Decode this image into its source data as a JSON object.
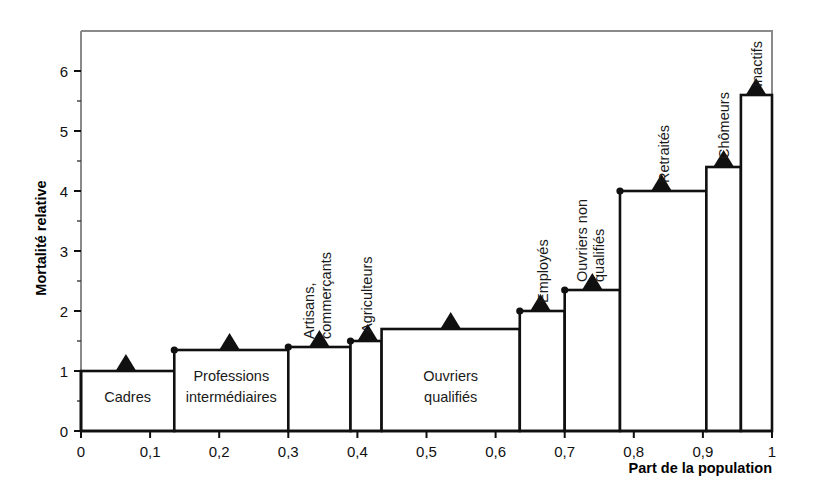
{
  "chart_data": {
    "type": "bar",
    "title": "",
    "xlabel": "Part de la population",
    "ylabel": "Mortalité relative",
    "xlim": [
      0,
      1
    ],
    "ylim": [
      0,
      6.5
    ],
    "grid": false,
    "legend": null,
    "note": "Variable-width (Marimekko / step) bar chart: bar width = share of population, bar height = relative mortality. Triangle markers sit on each bar top; small dots mark bar-top corners.",
    "xticks": [
      "0",
      "0,1",
      "0,2",
      "0,3",
      "0,4",
      "0,5",
      "0,6",
      "0,7",
      "0,8",
      "0,9",
      "1"
    ],
    "xtick_values": [
      0,
      0.1,
      0.2,
      0.3,
      0.4,
      0.5,
      0.6,
      0.7,
      0.8,
      0.9,
      1
    ],
    "yticks": [
      "0",
      "1",
      "2",
      "3",
      "4",
      "5",
      "6"
    ],
    "ytick_values": [
      0,
      1,
      2,
      3,
      4,
      5,
      6
    ],
    "categories": [
      "Cadres",
      "Professions intermédiaires",
      "Artisans, commerçants",
      "Agriculteurs",
      "Ouvriers qualifiés",
      "Employés",
      "Ouvriers non qualifiés",
      "Retraités",
      "Chômeurs",
      "Inactifs"
    ],
    "values": [
      1.0,
      1.35,
      1.4,
      1.5,
      1.7,
      2.0,
      2.35,
      4.0,
      4.4,
      5.6
    ],
    "x_start": [
      0.0,
      0.135,
      0.3,
      0.39,
      0.435,
      0.635,
      0.7,
      0.78,
      0.905,
      0.955
    ],
    "x_end": [
      0.135,
      0.3,
      0.39,
      0.435,
      0.635,
      0.7,
      0.78,
      0.905,
      0.955,
      1.0
    ],
    "widths": [
      0.135,
      0.165,
      0.09,
      0.045,
      0.2,
      0.065,
      0.08,
      0.125,
      0.05,
      0.045
    ],
    "bars": [
      {
        "label": "Cadres",
        "value": 1.0,
        "x_start": 0.0,
        "x_end": 0.135,
        "label_orient": "horizontal",
        "label_lines": [
          "Cadres"
        ]
      },
      {
        "label": "Professions intermédiaires",
        "value": 1.35,
        "x_start": 0.135,
        "x_end": 0.3,
        "label_orient": "horizontal",
        "label_lines": [
          "Professions",
          "intermédiaires"
        ]
      },
      {
        "label": "Artisans, commerçants",
        "value": 1.4,
        "x_start": 0.3,
        "x_end": 0.39,
        "label_orient": "vertical",
        "label_lines": [
          "Artisans,",
          "commerçants"
        ]
      },
      {
        "label": "Agriculteurs",
        "value": 1.5,
        "x_start": 0.39,
        "x_end": 0.435,
        "label_orient": "vertical",
        "label_lines": [
          "Agriculteurs"
        ]
      },
      {
        "label": "Ouvriers qualifiés",
        "value": 1.7,
        "x_start": 0.435,
        "x_end": 0.635,
        "label_orient": "horizontal",
        "label_lines": [
          "Ouvriers",
          "qualifiés"
        ]
      },
      {
        "label": "Employés",
        "value": 2.0,
        "x_start": 0.635,
        "x_end": 0.7,
        "label_orient": "vertical",
        "label_lines": [
          "Employés"
        ]
      },
      {
        "label": "Ouvriers non qualifiés",
        "value": 2.35,
        "x_start": 0.7,
        "x_end": 0.78,
        "label_orient": "vertical",
        "label_lines": [
          "Ouvriers non",
          "qualifiés"
        ]
      },
      {
        "label": "Retraités",
        "value": 4.0,
        "x_start": 0.78,
        "x_end": 0.905,
        "label_orient": "vertical",
        "label_lines": [
          "Retraités"
        ]
      },
      {
        "label": "Chômeurs",
        "value": 4.4,
        "x_start": 0.905,
        "x_end": 0.955,
        "label_orient": "vertical",
        "label_lines": [
          "Chômeurs"
        ]
      },
      {
        "label": "Inactifs",
        "value": 5.6,
        "x_start": 0.955,
        "x_end": 1.0,
        "label_orient": "vertical",
        "label_lines": [
          "Inactifs"
        ]
      }
    ],
    "markers": {
      "type": "triangle",
      "points": [
        {
          "x": 0.065,
          "y": 1.0
        },
        {
          "x": 0.215,
          "y": 1.35
        },
        {
          "x": 0.345,
          "y": 1.4
        },
        {
          "x": 0.415,
          "y": 1.5
        },
        {
          "x": 0.535,
          "y": 1.7
        },
        {
          "x": 0.665,
          "y": 2.0
        },
        {
          "x": 0.74,
          "y": 2.35
        },
        {
          "x": 0.84,
          "y": 4.0
        },
        {
          "x": 0.93,
          "y": 4.4
        },
        {
          "x": 0.977,
          "y": 5.6
        }
      ]
    },
    "corner_dots": [
      {
        "x": 0.135,
        "y": 1.35
      },
      {
        "x": 0.3,
        "y": 1.4
      },
      {
        "x": 0.39,
        "y": 1.5
      },
      {
        "x": 0.635,
        "y": 2.0
      },
      {
        "x": 0.7,
        "y": 2.35
      },
      {
        "x": 0.78,
        "y": 4.0
      }
    ],
    "colors": {
      "bar_fill": "#ffffff",
      "bar_stroke": "#101010",
      "marker": "#101010",
      "axis": "#101010",
      "frame": "#8a8a8a",
      "text": "#111111",
      "background": "#ffffff"
    }
  }
}
